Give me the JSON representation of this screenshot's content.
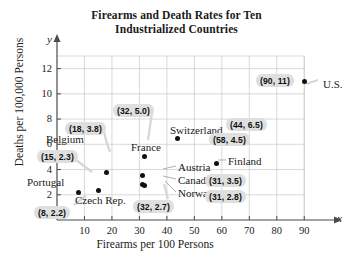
{
  "chart_data": {
    "type": "scatter",
    "title": "Firearms and Death Rates for Ten Industrialized Countries",
    "title_lines": [
      "Firearms and Death Rates for Ten",
      "Industrialized Countries"
    ],
    "xlabel": "Firearms per 100 Persons",
    "ylabel": "Deaths per 100,000 Persons",
    "x_axis_letter": "x",
    "y_axis_letter": "y",
    "xlim": [
      0,
      95
    ],
    "ylim": [
      0,
      13
    ],
    "xticks": [
      10,
      20,
      30,
      40,
      50,
      60,
      70,
      80,
      90
    ],
    "yticks": [
      2,
      4,
      6,
      8,
      10,
      12
    ],
    "grid": true,
    "legend": "none",
    "points": [
      {
        "label": "Portugal",
        "x": 8,
        "y": 2.2,
        "value_label": "(8, 2.2)"
      },
      {
        "label": "Czech Rep.",
        "x": 15,
        "y": 2.3,
        "value_label": "(15, 2.3)"
      },
      {
        "label": "Belgium",
        "x": 18,
        "y": 3.8,
        "value_label": "(18, 3.8)"
      },
      {
        "label": "Canada",
        "x": 31,
        "y": 2.8,
        "value_label": "(31, 2.8)"
      },
      {
        "label": "Austria",
        "x": 31,
        "y": 3.5,
        "value_label": "(31, 3.5)"
      },
      {
        "label": "Norway",
        "x": 32,
        "y": 2.7,
        "value_label": "(32, 2.7)"
      },
      {
        "label": "France",
        "x": 32,
        "y": 5.0,
        "value_label": "(32, 5.0)"
      },
      {
        "label": "Switzerland",
        "x": 44,
        "y": 6.5,
        "value_label": "(44, 6.5)"
      },
      {
        "label": "Finland",
        "x": 58,
        "y": 4.5,
        "value_label": "(58, 4.5)"
      },
      {
        "label": "U.S.",
        "x": 90,
        "y": 11,
        "value_label": "(90, 11)"
      }
    ]
  },
  "value_labels": [
    {
      "text": "(32, 5.0)",
      "left": 113,
      "top": 104
    },
    {
      "text": "(18, 3.8)",
      "left": 65,
      "top": 122
    },
    {
      "text": "(15, 2.3)",
      "left": 37,
      "top": 150
    },
    {
      "text": "(8, 2.2)",
      "left": 34,
      "top": 206
    },
    {
      "text": "(32, 2.7)",
      "left": 133,
      "top": 200
    },
    {
      "text": "(44, 6.5)",
      "left": 226,
      "top": 118
    },
    {
      "text": "(58, 4.5)",
      "left": 209,
      "top": 133
    },
    {
      "text": "(31, 3.5)",
      "left": 205,
      "top": 174
    },
    {
      "text": "(31, 2.8)",
      "left": 205,
      "top": 190
    },
    {
      "text": "(90, 11)",
      "left": 256,
      "top": 74
    }
  ],
  "country_names": [
    {
      "text": "U.S.",
      "left": 323,
      "top": 78
    },
    {
      "text": "Switzerland",
      "left": 170,
      "top": 124
    },
    {
      "text": "France",
      "left": 131,
      "top": 141
    },
    {
      "text": "Belgium",
      "left": 46,
      "top": 133
    },
    {
      "text": "Portugal",
      "left": 27,
      "top": 176
    },
    {
      "text": "Czech Rep.",
      "left": 75,
      "top": 194
    },
    {
      "text": "Austria",
      "left": 178,
      "top": 161
    },
    {
      "text": "Canada",
      "left": 178,
      "top": 174
    },
    {
      "text": "Norway",
      "left": 178,
      "top": 187
    },
    {
      "text": "Finland",
      "left": 228,
      "top": 155
    }
  ]
}
